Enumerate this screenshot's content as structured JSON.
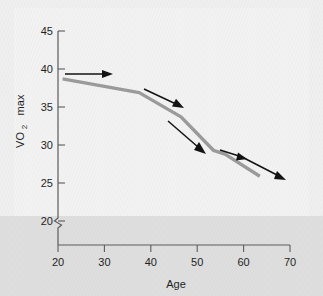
{
  "chart_data": {
    "type": "line",
    "title": "",
    "xlabel": "Age",
    "ylabel": "VO2 max",
    "ylabel_main": "VO",
    "ylabel_sub": "2",
    "ylabel_tail": "max",
    "xlim": [
      20,
      70
    ],
    "ylim": [
      20,
      45
    ],
    "y_axis_break": true,
    "y_axis_break_symbol": "broken-axis-zigzag",
    "grid": false,
    "legend": false,
    "xticks": [
      "20",
      "30",
      "40",
      "50",
      "60",
      "70"
    ],
    "xtick_values": [
      20,
      30,
      40,
      50,
      60,
      70
    ],
    "yticks": [
      "20",
      "25",
      "30",
      "35",
      "40",
      "45"
    ],
    "ytick_values": [
      20,
      25,
      30,
      35,
      40,
      45
    ],
    "series": [
      {
        "name": "VO2 max decline with age",
        "color": "#9a9a9a",
        "x": [
          21,
          37.5,
          46.5,
          53.5,
          56,
          63.5
        ],
        "values": [
          38.7,
          36.9,
          33.7,
          29.3,
          28.8,
          25.9
        ]
      }
    ],
    "annotations": [
      {
        "name": "trend-arrow-1",
        "x1": 21.5,
        "y1": 39.3,
        "x2": 31.0,
        "y2": 39.3,
        "note": "gentle decline segment"
      },
      {
        "name": "trend-arrow-2",
        "x1": 38.5,
        "y1": 37.2,
        "x2": 47.0,
        "y2": 34.5,
        "note": "steeper decline segment"
      },
      {
        "name": "trend-arrow-3",
        "x1": 44.0,
        "y1": 32.4,
        "x2": 52.0,
        "y2": 29.3,
        "note": "steepest decline segment"
      },
      {
        "name": "trend-arrow-4",
        "x1": 55.0,
        "y1": 29.1,
        "x2": 60.0,
        "y2": 28.1,
        "note": "flattening segment"
      },
      {
        "name": "trend-arrow-5",
        "x1": 59.5,
        "y1": 28.0,
        "x2": 68.0,
        "y2": 25.5,
        "note": "terminal decline segment"
      }
    ]
  }
}
